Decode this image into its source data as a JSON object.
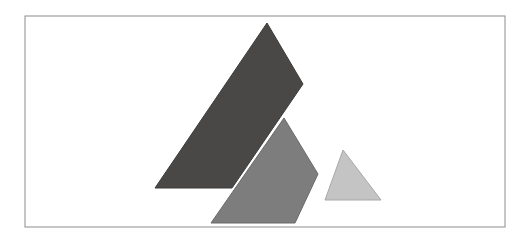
{
  "figure": {
    "title": "",
    "background_color": "#ffffff",
    "width": 532,
    "height": 245,
    "frame": {
      "name": "image-border-frame",
      "x": 25,
      "y": 16,
      "width": 480,
      "height": 211,
      "stroke_color": "#8c8c8c",
      "stroke_width": 1,
      "fill": "none"
    },
    "shapes": [
      {
        "id": "dark-quadrilateral",
        "label": "dark slanted quadrilateral",
        "kind": "polygon",
        "fill_color": "#4a4747",
        "stroke_color": "#3d3a3a",
        "stroke_width": 1,
        "points": "267,23 303,84 232,188 155,188"
      },
      {
        "id": "medium-gray-pentagon",
        "label": "medium gray mountain shape",
        "kind": "polygon",
        "fill_color": "#7d7d7d",
        "stroke_color": "#6a6a6a",
        "stroke_width": 1,
        "points": "284,118 318,174 295,223 211,223"
      },
      {
        "id": "light-gray-triangle",
        "label": "light gray triangle",
        "kind": "polygon",
        "fill_color": "#c4c4c4",
        "stroke_color": "#a8a8a8",
        "stroke_width": 1,
        "points": "343,150 381,200 325,200"
      }
    ]
  }
}
